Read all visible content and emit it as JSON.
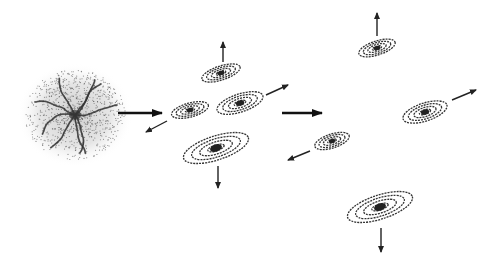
{
  "diagram": {
    "stages": [
      {
        "name": "protogalactic-cloud",
        "cx": 75,
        "cy": 115
      },
      {
        "name": "early-galaxies",
        "galaxies": [
          {
            "cx": 221,
            "cy": 73,
            "rx": 20,
            "ry": 7,
            "rot": -18,
            "arrow": [
              223,
              62,
              223,
              42
            ]
          },
          {
            "cx": 190,
            "cy": 110,
            "rx": 19,
            "ry": 7,
            "rot": -15,
            "arrow": [
              167,
              121,
              146,
              132
            ]
          },
          {
            "cx": 240,
            "cy": 103,
            "rx": 24,
            "ry": 9,
            "rot": -18,
            "arrow": [
              266,
              95,
              288,
              85
            ]
          },
          {
            "cx": 216,
            "cy": 148,
            "rx": 34,
            "ry": 12,
            "rot": -18,
            "arrow": [
              218,
              166,
              218,
              188
            ]
          }
        ]
      },
      {
        "name": "expanded-galaxies",
        "galaxies": [
          {
            "cx": 377,
            "cy": 48,
            "rx": 19,
            "ry": 7,
            "rot": -18,
            "arrow": [
              377,
              36,
              377,
              13
            ]
          },
          {
            "cx": 425,
            "cy": 112,
            "rx": 23,
            "ry": 9,
            "rot": -18,
            "arrow": [
              452,
              100,
              476,
              90
            ]
          },
          {
            "cx": 332,
            "cy": 141,
            "rx": 18,
            "ry": 7,
            "rot": -18,
            "arrow": [
              310,
              151,
              288,
              160
            ]
          },
          {
            "cx": 380,
            "cy": 207,
            "rx": 34,
            "ry": 12,
            "rot": -18,
            "arrow": [
              381,
              228,
              381,
              252
            ]
          }
        ]
      }
    ],
    "transition_arrows": [
      [
        118,
        113,
        162,
        113
      ],
      [
        282,
        113,
        322,
        113
      ]
    ],
    "colors": {
      "ink": "#222222",
      "cloud": "#9a9a9a"
    }
  }
}
